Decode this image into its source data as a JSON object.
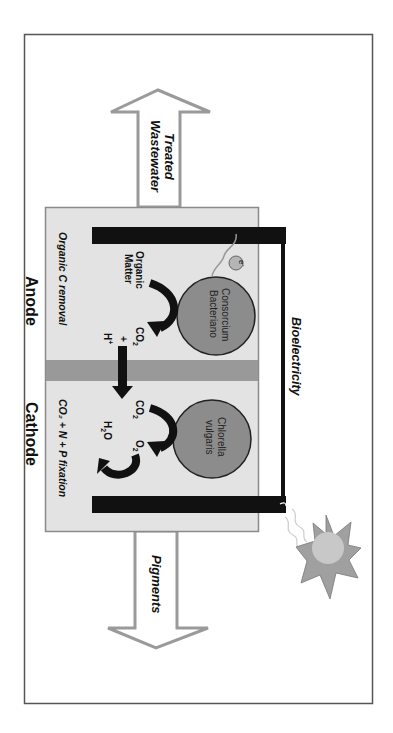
{
  "diagram": {
    "orientation": "rotated 90deg clockwise",
    "outputs": {
      "top_arrow": {
        "line1": "Treated",
        "line2": "Wastewater"
      },
      "bottom_arrow": {
        "label": "Pigments"
      }
    },
    "chambers": {
      "anode": {
        "label": "Anode",
        "process_label": "Organic C removal",
        "organism": {
          "line1": "Consorcium",
          "line2": "Bacteriano"
        },
        "substrate": {
          "line1": "Organic",
          "line2": "Matter"
        },
        "products": {
          "co2": "CO",
          "co2_sub": "2",
          "plus": "+",
          "h": "H",
          "h_sup": "+"
        },
        "electron": {
          "base": "e",
          "sup": "-"
        }
      },
      "cathode": {
        "label": "Cathode",
        "process_label": "CO₂ + N + P fixation",
        "organism": {
          "line1": "Chlorella",
          "line2": "vulgaris"
        },
        "inputs": {
          "co2": "CO",
          "co2_sub": "2"
        },
        "products": {
          "o2": "O",
          "o2_sub": "2",
          "h2o_h": "H",
          "h2o_sub": "2",
          "h2o_o": "O"
        }
      }
    },
    "circuit_label": "Bioelectricity",
    "light_source": "sun",
    "colors": {
      "frame": "#555555",
      "chamber_fill": "#e3e3e3",
      "chamber_border": "#8a8a8a",
      "membrane": "#999999",
      "electrode": "#111111",
      "organism_fill": "#8c8c8c",
      "arrow_outline": "#9a9a9a",
      "sun_rays": "#a0a0a0",
      "sun_core": "#c8c8c8"
    }
  }
}
